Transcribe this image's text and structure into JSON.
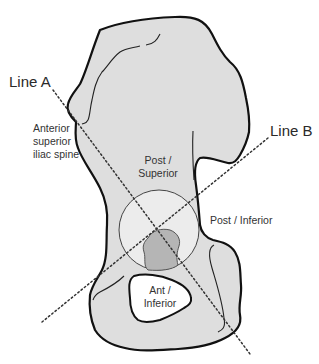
{
  "diagram": {
    "colors": {
      "bone_fill": "#dedede",
      "outline": "#111111",
      "acetabulum_fill": "#ececec",
      "fossa_fill": "#b5b5b5",
      "foramen_fill": "#ffffff",
      "dotted_line": "#333333"
    },
    "lines": {
      "line_a": "Line  A",
      "line_b": "Line B"
    },
    "labels": {
      "asis_1": "Anterior",
      "asis_2": "superior",
      "asis_3": "iliac spine",
      "post_superior_1": "Post /",
      "post_superior_2": "Superior",
      "post_inferior": "Post / Inferior",
      "ant_inferior_1": "Ant /",
      "ant_inferior_2": "Inferior"
    }
  }
}
